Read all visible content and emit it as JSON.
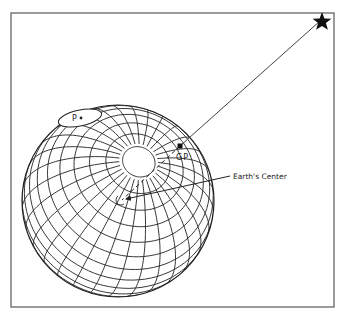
{
  "diagram": {
    "labels": {
      "pole": "P",
      "geographic_position": "GP",
      "earth_center": "Earth's Center"
    },
    "icons": {
      "star": "star-icon"
    },
    "colors": {
      "ink": "#222222",
      "frame": "#666666",
      "background": "#ffffff"
    }
  }
}
